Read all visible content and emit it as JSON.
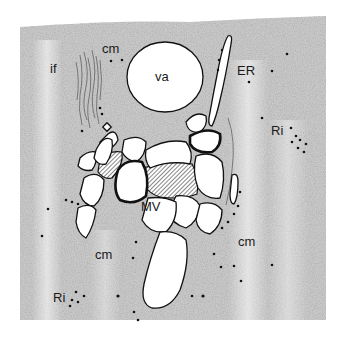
{
  "figure": {
    "type": "stippled histological illustration",
    "background_color": "#ffffff",
    "stipple_color": "#8a8a8a",
    "ink_color": "#111111"
  },
  "labels": {
    "if": "if",
    "cm_top": "cm",
    "va": "va",
    "ER": "ER",
    "Ri_right": "Ri",
    "MV": "MV",
    "cm_left": "cm",
    "cm_right": "cm",
    "Ri_left": "Ri"
  },
  "structures": [
    {
      "id": "va",
      "description": "vacuole (large round clear space)"
    },
    {
      "id": "ER",
      "description": "endoplasmic reticulum (elongated cisterna)"
    },
    {
      "id": "MV",
      "description": "multivesicular body / cluster of vesicles with hatched interstitial areas"
    },
    {
      "id": "cm",
      "description": "cytoplasmic matrix"
    },
    {
      "id": "Ri",
      "description": "ribosomes (black dots)"
    },
    {
      "id": "if",
      "description": "intermediate filaments (wavy lines)"
    }
  ]
}
